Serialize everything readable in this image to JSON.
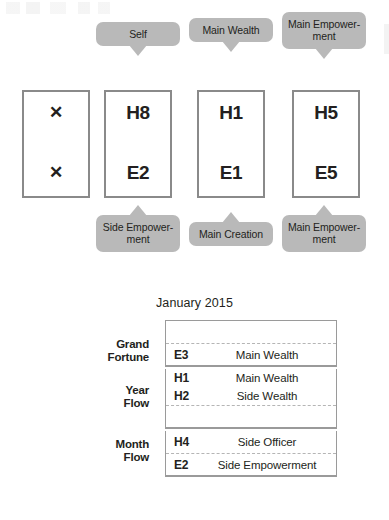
{
  "artifacts": {
    "top_smudge": "scan-artifact"
  },
  "pillars": {
    "columns": [
      {
        "id": "col-1",
        "top_bubble": null,
        "box": {
          "heaven": "✕",
          "earth": "✕",
          "empty": true
        },
        "bottom_bubble": null
      },
      {
        "id": "col-2",
        "top_bubble": "Self",
        "box": {
          "heaven": "H8",
          "earth": "E2",
          "empty": false
        },
        "bottom_bubble": "Side Empower- ment"
      },
      {
        "id": "col-3",
        "top_bubble": "Main Wealth",
        "box": {
          "heaven": "H1",
          "earth": "E1",
          "empty": false
        },
        "bottom_bubble": "Main Creation"
      },
      {
        "id": "col-4",
        "top_bubble": "Main Empower- ment",
        "box": {
          "heaven": "H5",
          "earth": "E5",
          "empty": false
        },
        "bottom_bubble": "Main Empower- ment"
      }
    ]
  },
  "table": {
    "title": "January 2015",
    "sections": [
      {
        "label": "Grand Fortune",
        "rows": [
          {
            "code": "",
            "desc": "",
            "blank": true,
            "dashed": false
          },
          {
            "code": "E3",
            "desc": "Main Wealth",
            "blank": false,
            "dashed": true
          }
        ]
      },
      {
        "label": "Year Flow",
        "rows": [
          {
            "code": "H1",
            "desc": "Main Wealth",
            "blank": false,
            "dashed": false
          },
          {
            "code": "H2",
            "desc": "Side Wealth",
            "blank": false,
            "dashed": false
          },
          {
            "code": "",
            "desc": "",
            "blank": true,
            "dashed": true
          }
        ]
      },
      {
        "label": "Month Flow",
        "rows": [
          {
            "code": "H4",
            "desc": "Side Officer",
            "blank": false,
            "dashed": false
          },
          {
            "code": "E2",
            "desc": "Side Empowerment",
            "blank": false,
            "dashed": true
          }
        ]
      }
    ]
  },
  "colors": {
    "bubble_gray": "#b9b9b9",
    "box_border": "#8a8a8a",
    "table_border": "#9a9a9a",
    "dashed_rule": "#b5b5b5",
    "text": "#231f20",
    "background": "#ffffff"
  }
}
